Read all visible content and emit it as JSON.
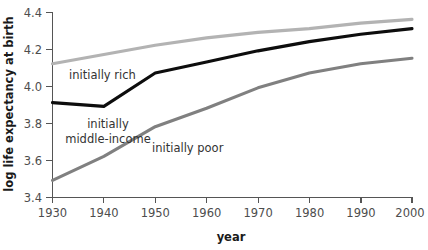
{
  "chart_data": {
    "type": "line",
    "title": "",
    "subtitle": "",
    "xlabel": "year",
    "ylabel": "log life expectancy at birth",
    "x": [
      1930,
      1940,
      1950,
      1960,
      1970,
      1980,
      1990,
      2000
    ],
    "xticks": [
      "1930",
      "1940",
      "1950",
      "1960",
      "1970",
      "1980",
      "1990",
      "2000"
    ],
    "yticks": [
      "3.4",
      "3.6",
      "3.8",
      "4.0",
      "4.2",
      "4.4"
    ],
    "xlim": [
      1930,
      2000
    ],
    "ylim": [
      3.4,
      4.4
    ],
    "grid": false,
    "legend_position": "inline-annotations",
    "series": [
      {
        "name": "initially rich",
        "color": "#b3b3b3",
        "values": [
          4.12,
          4.17,
          4.22,
          4.26,
          4.29,
          4.31,
          4.34,
          4.36
        ]
      },
      {
        "name": "initially middle-income",
        "color": "#0d0d0d",
        "values": [
          3.91,
          3.89,
          4.07,
          4.13,
          4.19,
          4.24,
          4.28,
          4.31
        ]
      },
      {
        "name": "initially poor",
        "color": "#808080",
        "values": [
          3.49,
          3.62,
          3.78,
          3.88,
          3.99,
          4.07,
          4.12,
          4.15
        ]
      }
    ],
    "annotations": [
      {
        "text": "initially rich",
        "series": "initially rich"
      },
      {
        "text": "initially",
        "series": "initially middle-income"
      },
      {
        "text": "middle-income",
        "series": "initially middle-income"
      },
      {
        "text": "initially poor",
        "series": "initially poor"
      }
    ]
  }
}
